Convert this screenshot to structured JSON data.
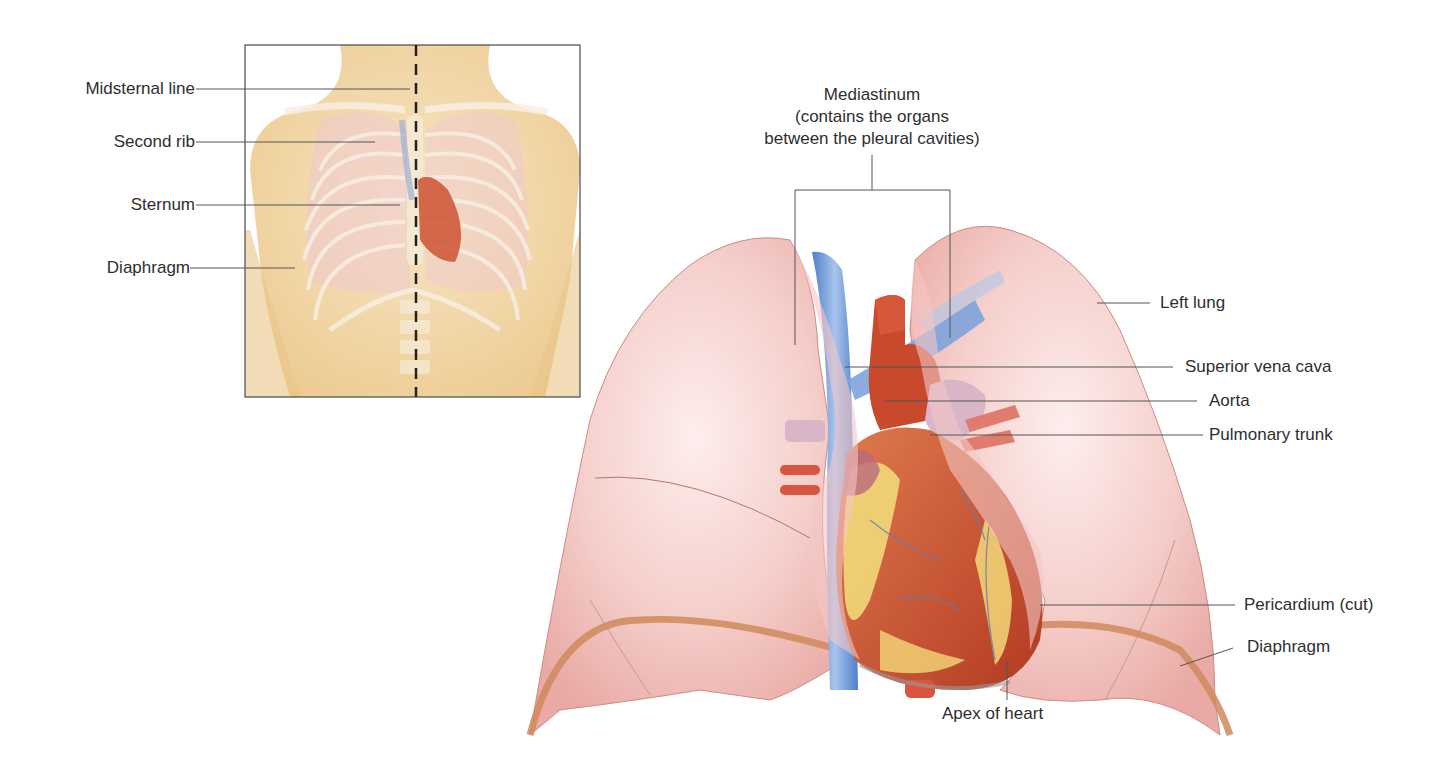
{
  "inset": {
    "labels": [
      {
        "id": "midsternal-line",
        "text": "Midsternal line"
      },
      {
        "id": "second-rib",
        "text": "Second rib"
      },
      {
        "id": "sternum",
        "text": "Sternum"
      },
      {
        "id": "diaphragm",
        "text": "Diaphragm"
      }
    ]
  },
  "main": {
    "mediastinum": {
      "title": "Mediastinum",
      "line2": "(contains the organs",
      "line3": "between the pleural cavities)"
    },
    "labels": [
      {
        "id": "left-lung",
        "text": "Left lung"
      },
      {
        "id": "superior-vena-cava",
        "text": "Superior vena cava"
      },
      {
        "id": "aorta",
        "text": "Aorta"
      },
      {
        "id": "pulmonary-trunk",
        "text": "Pulmonary trunk"
      },
      {
        "id": "pericardium",
        "text": "Pericardium (cut)"
      },
      {
        "id": "diaphragm",
        "text": "Diaphragm"
      },
      {
        "id": "apex-of-heart",
        "text": "Apex of heart"
      }
    ]
  },
  "colors": {
    "skin": "#f3dcb0",
    "lung": "#f2c4c0",
    "lung_light": "#fbe6e3",
    "heart": "#c9462c",
    "fat": "#f2d878",
    "vein": "#6f9ad6",
    "artery": "#d9553f",
    "pulmonary": "#d8b4c8",
    "diaphragm_band": "#cf8a5c",
    "leader": "#555555"
  }
}
